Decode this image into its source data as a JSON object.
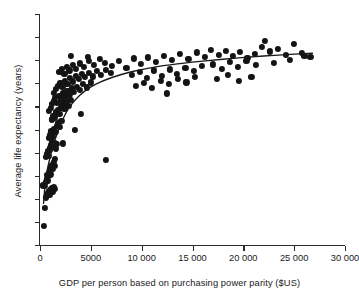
{
  "chart_data": {
    "type": "scatter",
    "title": "",
    "xlabel": "GDP per person based on purchasing power parity ($US)",
    "ylabel": "Average life expectancy (years)",
    "xlim": [
      0,
      30000
    ],
    "ylim": [
      35,
      85
    ],
    "xticks": [
      0,
      5000,
      10000,
      15000,
      20000,
      25000,
      30000
    ],
    "xtick_labels": [
      "0",
      "5000",
      "10 000",
      "15 000",
      "20 000",
      "25 000",
      "30 000"
    ],
    "yticks": [
      35,
      40,
      45,
      50,
      55,
      60,
      65,
      70,
      75,
      80,
      85
    ],
    "ytick_labels": [
      "35",
      "40",
      "45",
      "50",
      "55",
      "60",
      "65",
      "70",
      "75",
      "80",
      "85"
    ],
    "grid": false,
    "legend": null,
    "marker_color": "#141414",
    "curve_color": "#1a1a1a",
    "series": [
      {
        "name": "Countries",
        "points": [
          [
            380,
            39.1
          ],
          [
            450,
            43.0
          ],
          [
            520,
            47.8
          ],
          [
            300,
            47.9
          ],
          [
            600,
            45.3
          ],
          [
            700,
            45.6
          ],
          [
            760,
            46.0
          ],
          [
            830,
            46.3
          ],
          [
            900,
            46.6
          ],
          [
            980,
            45.9
          ],
          [
            1050,
            47.1
          ],
          [
            1150,
            47.3
          ],
          [
            1250,
            46.5
          ],
          [
            1350,
            47.6
          ],
          [
            1500,
            47.2
          ],
          [
            560,
            48.6
          ],
          [
            640,
            49.3
          ],
          [
            720,
            50.1
          ],
          [
            800,
            49.0
          ],
          [
            880,
            50.6
          ],
          [
            950,
            51.2
          ],
          [
            1020,
            50.3
          ],
          [
            1100,
            51.8
          ],
          [
            1180,
            52.4
          ],
          [
            1260,
            51.4
          ],
          [
            1340,
            53.0
          ],
          [
            1420,
            52.1
          ],
          [
            1500,
            53.6
          ],
          [
            620,
            54.0
          ],
          [
            700,
            54.8
          ],
          [
            780,
            55.4
          ],
          [
            860,
            54.3
          ],
          [
            940,
            56.0
          ],
          [
            1010,
            55.7
          ],
          [
            1090,
            56.6
          ],
          [
            1170,
            57.2
          ],
          [
            1250,
            56.3
          ],
          [
            1480,
            57.0
          ],
          [
            1560,
            55.9
          ],
          [
            1700,
            56.8
          ],
          [
            2250,
            57.0
          ],
          [
            6500,
            53.5
          ],
          [
            900,
            58.2
          ],
          [
            1000,
            58.9
          ],
          [
            1120,
            59.6
          ],
          [
            1260,
            58.5
          ],
          [
            1400,
            60.2
          ],
          [
            1520,
            59.4
          ],
          [
            1650,
            60.8
          ],
          [
            1800,
            61.4
          ],
          [
            1950,
            60.5
          ],
          [
            2100,
            61.9
          ],
          [
            3400,
            60.0
          ],
          [
            4000,
            63.3
          ],
          [
            1150,
            62.2
          ],
          [
            1300,
            63.0
          ],
          [
            1450,
            62.6
          ],
          [
            1600,
            63.7
          ],
          [
            1750,
            64.2
          ],
          [
            1900,
            63.4
          ],
          [
            2050,
            64.8
          ],
          [
            2200,
            65.3
          ],
          [
            2400,
            64.5
          ],
          [
            2600,
            65.9
          ],
          [
            2800,
            65.1
          ],
          [
            3000,
            66.4
          ],
          [
            900,
            64.0
          ],
          [
            1050,
            64.7
          ],
          [
            1200,
            65.5
          ],
          [
            1350,
            66.1
          ],
          [
            1500,
            66.8
          ],
          [
            1700,
            65.7
          ],
          [
            1900,
            67.2
          ],
          [
            2100,
            66.5
          ],
          [
            2300,
            67.8
          ],
          [
            2500,
            67.0
          ],
          [
            2700,
            68.4
          ],
          [
            2900,
            67.6
          ],
          [
            3100,
            68.9
          ],
          [
            3300,
            68.1
          ],
          [
            3600,
            69.3
          ],
          [
            3900,
            68.6
          ],
          [
            4200,
            69.8
          ],
          [
            4600,
            69.1
          ],
          [
            5000,
            70.2
          ],
          [
            1400,
            68.0
          ],
          [
            1600,
            68.7
          ],
          [
            1800,
            69.4
          ],
          [
            2000,
            70.0
          ],
          [
            2200,
            69.2
          ],
          [
            2450,
            70.6
          ],
          [
            2700,
            69.9
          ],
          [
            2950,
            71.1
          ],
          [
            3200,
            70.4
          ],
          [
            3500,
            71.6
          ],
          [
            3800,
            70.9
          ],
          [
            4100,
            72.0
          ],
          [
            4400,
            71.3
          ],
          [
            4800,
            72.3
          ],
          [
            5200,
            71.5
          ],
          [
            5600,
            72.6
          ],
          [
            6000,
            71.8
          ],
          [
            6500,
            72.9
          ],
          [
            7000,
            72.2
          ],
          [
            1900,
            72.5
          ],
          [
            2150,
            73.1
          ],
          [
            2400,
            72.0
          ],
          [
            2650,
            73.5
          ],
          [
            2900,
            72.8
          ],
          [
            3200,
            73.9
          ],
          [
            3500,
            73.2
          ],
          [
            3900,
            74.3
          ],
          [
            4300,
            73.6
          ],
          [
            4800,
            74.8
          ],
          [
            5300,
            74.0
          ],
          [
            5900,
            75.2
          ],
          [
            3000,
            75.9
          ],
          [
            4700,
            75.8
          ],
          [
            6400,
            74.5
          ],
          [
            7100,
            73.8
          ],
          [
            7800,
            74.9
          ],
          [
            8500,
            73.4
          ],
          [
            9200,
            75.4
          ],
          [
            9900,
            74.2
          ],
          [
            10600,
            75.6
          ],
          [
            11400,
            74.6
          ],
          [
            12200,
            76.0
          ],
          [
            13000,
            75.0
          ],
          [
            13800,
            76.3
          ],
          [
            14600,
            75.3
          ],
          [
            15400,
            76.7
          ],
          [
            16200,
            75.7
          ],
          [
            9000,
            71.9
          ],
          [
            9800,
            72.4
          ],
          [
            10500,
            71.2
          ],
          [
            11200,
            72.8
          ],
          [
            12000,
            71.6
          ],
          [
            12800,
            73.0
          ],
          [
            13500,
            72.1
          ],
          [
            14300,
            73.4
          ],
          [
            15100,
            72.6
          ],
          [
            15900,
            73.8
          ],
          [
            9400,
            69.4
          ],
          [
            10200,
            70.1
          ],
          [
            11000,
            69.0
          ],
          [
            11900,
            70.5
          ],
          [
            12700,
            69.8
          ],
          [
            13600,
            70.9
          ],
          [
            14400,
            70.2
          ],
          [
            15200,
            71.3
          ],
          [
            12500,
            67.8
          ],
          [
            16800,
            77.3
          ],
          [
            17600,
            76.1
          ],
          [
            18300,
            77.0
          ],
          [
            19000,
            75.9
          ],
          [
            19700,
            76.8
          ],
          [
            20400,
            75.5
          ],
          [
            21100,
            76.4
          ],
          [
            21800,
            77.8
          ],
          [
            17000,
            74.1
          ],
          [
            17900,
            73.2
          ],
          [
            18700,
            74.7
          ],
          [
            19500,
            73.6
          ],
          [
            20300,
            74.9
          ],
          [
            21200,
            73.9
          ],
          [
            17400,
            71.0
          ],
          [
            18500,
            71.8
          ],
          [
            19600,
            70.6
          ],
          [
            20800,
            71.4
          ],
          [
            22600,
            76.9
          ],
          [
            23400,
            77.5
          ],
          [
            24200,
            76.2
          ],
          [
            25000,
            78.6
          ],
          [
            25800,
            76.6
          ],
          [
            26600,
            75.8
          ],
          [
            23000,
            74.4
          ],
          [
            24600,
            75.1
          ],
          [
            22100,
            79.2
          ],
          [
            26000,
            75.9
          ]
        ]
      }
    ],
    "fit_curve": {
      "name": "logarithmic trend",
      "points": [
        [
          350,
          44.0
        ],
        [
          500,
          48.0
        ],
        [
          650,
          50.5
        ],
        [
          800,
          52.2
        ],
        [
          1000,
          54.0
        ],
        [
          1300,
          56.5
        ],
        [
          1700,
          59.2
        ],
        [
          2200,
          62.0
        ],
        [
          2800,
          64.5
        ],
        [
          3500,
          66.5
        ],
        [
          4400,
          68.3
        ],
        [
          5500,
          69.8
        ],
        [
          7000,
          71.2
        ],
        [
          9000,
          72.5
        ],
        [
          11000,
          73.4
        ],
        [
          13500,
          74.2
        ],
        [
          16000,
          74.8
        ],
        [
          19000,
          75.4
        ],
        [
          22000,
          75.9
        ],
        [
          25000,
          76.3
        ],
        [
          26800,
          76.5
        ]
      ]
    }
  }
}
